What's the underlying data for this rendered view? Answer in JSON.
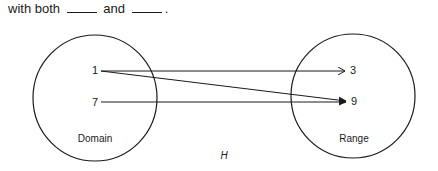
{
  "prompt": {
    "prefix": "with both",
    "middle": "and",
    "suffix": "."
  },
  "diagram": {
    "function_label": "H",
    "domain": {
      "label": "Domain",
      "elements": [
        "1",
        "7"
      ]
    },
    "range": {
      "label": "Range",
      "elements": [
        "3",
        "9"
      ]
    },
    "mappings": [
      {
        "from": "1",
        "to": "3"
      },
      {
        "from": "1",
        "to": "9"
      },
      {
        "from": "7",
        "to": "9"
      }
    ],
    "colors": {
      "stroke": "#1a1a1a",
      "background": "#ffffff"
    }
  }
}
